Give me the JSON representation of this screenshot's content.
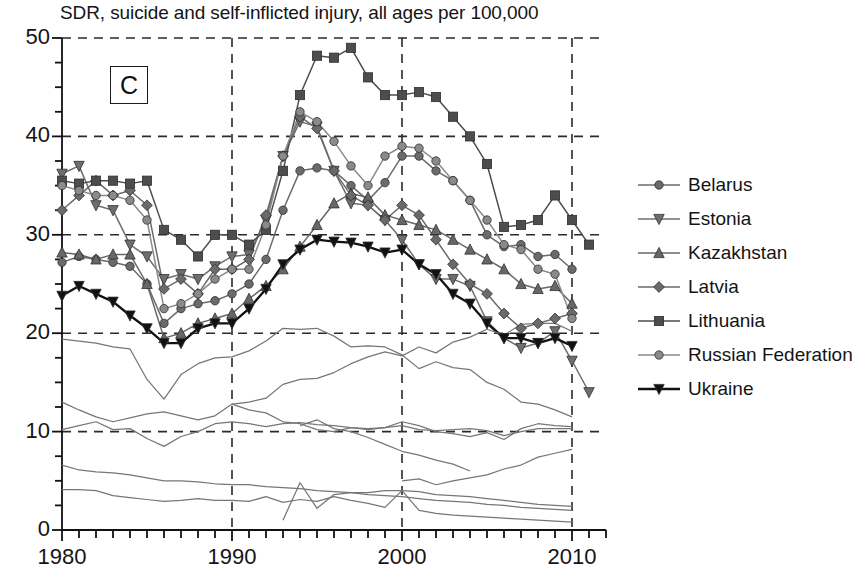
{
  "chart": {
    "title": "SDR, suicide and self-inflicted injury, all ages per 100,000",
    "panel_label": "C"
  },
  "axes": {
    "y_ticks": [
      "0",
      "10",
      "20",
      "30",
      "40",
      "50"
    ],
    "x_ticks": [
      "1980",
      "1990",
      "2000",
      "2010"
    ]
  },
  "legend": {
    "items": [
      {
        "label": "Belarus",
        "marker": "circle",
        "color": "#6b6b6b",
        "filled": true
      },
      {
        "label": "Estonia",
        "marker": "triangle-down",
        "color": "#6e6e6e",
        "filled": true
      },
      {
        "label": "Kazakhstan",
        "marker": "triangle-up",
        "color": "#676767",
        "filled": true
      },
      {
        "label": "Latvia",
        "marker": "diamond",
        "color": "#6a6a6a",
        "filled": true
      },
      {
        "label": "Lithuania",
        "marker": "square",
        "color": "#4d4d4d",
        "filled": true
      },
      {
        "label": "Russian Federation",
        "marker": "circle",
        "color": "#8a8a8a",
        "filled": true
      },
      {
        "label": "Ukraine",
        "marker": "triangle-down",
        "color": "#111111",
        "filled": true
      }
    ]
  },
  "chart_data": {
    "type": "line",
    "title": "SDR, suicide and self-inflicted injury, all ages per 100,000",
    "xlabel": "",
    "ylabel": "",
    "xlim": [
      1980,
      2012
    ],
    "ylim": [
      0,
      50
    ],
    "grid": true,
    "grid_y": [
      10,
      20,
      30,
      40,
      50
    ],
    "grid_x": [
      1990,
      2000,
      2010
    ],
    "legend_position": "right",
    "x": [
      1980,
      1981,
      1982,
      1983,
      1984,
      1985,
      1986,
      1987,
      1988,
      1989,
      1990,
      1991,
      1992,
      1993,
      1994,
      1995,
      1996,
      1997,
      1998,
      1999,
      2000,
      2001,
      2002,
      2003,
      2004,
      2005,
      2006,
      2007,
      2008,
      2009,
      2010,
      2011
    ],
    "series": [
      {
        "name": "Belarus",
        "marker": "circle",
        "color": "#6b6b6b",
        "values": [
          27.2,
          27.8,
          27.5,
          27.2,
          26.8,
          25.0,
          21.0,
          22.5,
          23.0,
          23.3,
          24.0,
          25.0,
          27.5,
          32.5,
          36.5,
          36.8,
          36.5,
          35.0,
          33.5,
          35.3,
          38.0,
          38.0,
          36.5,
          35.5,
          33.5,
          30.0,
          28.8,
          29.0,
          27.8,
          28.0,
          26.5,
          null
        ]
      },
      {
        "name": "Estonia",
        "marker": "triangle-down",
        "color": "#6e6e6e",
        "values": [
          36.2,
          37.0,
          33.0,
          32.5,
          29.0,
          27.8,
          25.5,
          26.0,
          25.5,
          26.8,
          27.8,
          28.0,
          31.5,
          38.0,
          41.5,
          41.0,
          36.5,
          33.2,
          33.0,
          31.5,
          29.5,
          27.0,
          25.5,
          25.5,
          24.8,
          21.2,
          19.5,
          18.5,
          19.0,
          20.2,
          17.2,
          14.0
        ]
      },
      {
        "name": "Kazakhstan",
        "marker": "triangle-up",
        "color": "#676767",
        "values": [
          28.2,
          28.0,
          27.5,
          28.0,
          28.0,
          25.0,
          19.5,
          20.0,
          21.0,
          21.5,
          22.0,
          23.5,
          24.8,
          26.5,
          28.8,
          31.0,
          33.2,
          34.2,
          33.8,
          32.0,
          31.5,
          31.0,
          30.5,
          29.5,
          28.5,
          27.5,
          26.5,
          25.0,
          24.5,
          24.8,
          23.0,
          null
        ]
      },
      {
        "name": "Latvia",
        "marker": "diamond",
        "color": "#6a6a6a",
        "values": [
          32.5,
          34.0,
          35.5,
          34.0,
          34.5,
          33.0,
          24.5,
          25.5,
          24.0,
          26.5,
          26.5,
          27.5,
          32.0,
          38.0,
          42.0,
          40.8,
          36.5,
          34.0,
          33.0,
          31.5,
          33.0,
          32.0,
          29.5,
          27.0,
          25.0,
          24.0,
          22.0,
          20.5,
          21.0,
          21.5,
          22.0,
          null
        ]
      },
      {
        "name": "Lithuania",
        "marker": "square",
        "color": "#4d4d4d",
        "values": [
          35.5,
          35.2,
          35.5,
          35.5,
          35.2,
          35.5,
          30.5,
          29.5,
          27.8,
          30.0,
          30.0,
          29.0,
          30.5,
          36.5,
          44.2,
          48.2,
          48.0,
          49.0,
          46.0,
          44.2,
          44.2,
          44.5,
          44.0,
          42.0,
          40.0,
          37.2,
          30.8,
          31.0,
          31.5,
          34.0,
          31.5,
          29.0
        ]
      },
      {
        "name": "Russian Federation",
        "marker": "circle",
        "color": "#8a8a8a",
        "values": [
          35.0,
          34.5,
          34.0,
          34.0,
          33.5,
          31.5,
          22.5,
          23.0,
          24.0,
          25.5,
          26.5,
          26.5,
          31.0,
          38.0,
          42.5,
          41.5,
          39.5,
          37.0,
          35.0,
          38.0,
          39.0,
          38.8,
          37.5,
          35.5,
          33.5,
          31.5,
          29.0,
          28.5,
          26.5,
          26.0,
          21.5,
          null
        ]
      },
      {
        "name": "Ukraine",
        "marker": "triangle-down",
        "color": "#111111",
        "values": [
          23.8,
          24.8,
          24.0,
          23.2,
          21.8,
          20.5,
          19.0,
          19.0,
          20.5,
          21.0,
          21.0,
          22.5,
          24.5,
          27.0,
          28.5,
          29.5,
          29.3,
          29.2,
          28.8,
          28.2,
          28.5,
          27.0,
          26.0,
          24.0,
          23.0,
          21.0,
          19.5,
          19.5,
          19.0,
          19.5,
          18.7,
          null
        ]
      },
      {
        "name": "background-1",
        "marker": "none",
        "color": "#7f7f7f",
        "values": [
          19.4,
          19.2,
          19.0,
          18.6,
          18.4,
          15.3,
          13.3,
          15.8,
          16.9,
          17.5,
          17.6,
          18.2,
          19.2,
          20.5,
          20.4,
          20.5,
          19.7,
          18.6,
          18.7,
          18.6,
          17.8,
          16.4,
          17.1,
          16.5,
          16.3,
          15.0,
          14.3,
          13.0,
          12.8,
          12.2,
          11.5,
          null
        ]
      },
      {
        "name": "background-2",
        "marker": "none",
        "color": "#7f7f7f",
        "values": [
          13.0,
          12.2,
          11.5,
          11.0,
          11.4,
          11.8,
          12.0,
          11.6,
          11.2,
          11.6,
          12.8,
          12.2,
          11.9,
          11.0,
          10.8,
          10.2,
          10.0,
          10.4,
          10.2,
          10.4,
          11.0,
          10.6,
          10.0,
          9.8,
          9.5,
          9.9,
          9.2,
          10.3,
          10.8,
          10.6,
          10.5,
          null
        ]
      },
      {
        "name": "background-3",
        "marker": "none",
        "color": "#7f7f7f",
        "values": [
          10.2,
          10.6,
          11.0,
          10.2,
          10.3,
          9.3,
          8.5,
          9.5,
          10.0,
          10.8,
          11.0,
          10.8,
          10.5,
          10.8,
          10.9,
          10.7,
          10.6,
          10.4,
          10.3,
          10.4,
          10.6,
          10.2,
          10.1,
          10.2,
          10.3,
          10.1,
          9.6,
          10.0,
          10.3,
          10.3,
          10.3,
          null
        ]
      },
      {
        "name": "background-4",
        "marker": "none",
        "color": "#7f7f7f",
        "values": [
          6.6,
          6.1,
          5.9,
          5.8,
          5.6,
          5.3,
          5.0,
          5.0,
          4.9,
          4.7,
          4.6,
          4.6,
          4.4,
          4.3,
          4.2,
          4.0,
          3.9,
          3.8,
          3.6,
          3.5,
          3.4,
          3.2,
          3.0,
          2.9,
          2.8,
          2.6,
          2.5,
          2.3,
          2.2,
          2.1,
          2.0,
          null
        ]
      },
      {
        "name": "background-5",
        "marker": "none",
        "color": "#7f7f7f",
        "values": [
          4.1,
          4.1,
          4.0,
          3.5,
          3.3,
          3.1,
          2.9,
          3.0,
          3.2,
          3.0,
          3.0,
          2.9,
          3.4,
          2.8,
          3.1,
          2.9,
          3.4,
          3.0,
          2.7,
          2.3,
          4.0,
          2.0,
          1.7,
          1.5,
          1.4,
          1.3,
          1.2,
          1.1,
          1.0,
          0.9,
          0.8,
          null
        ]
      },
      {
        "name": "background-6",
        "marker": "none",
        "color": "#7f7f7f",
        "values": [
          null,
          null,
          null,
          null,
          null,
          null,
          null,
          null,
          null,
          null,
          12.8,
          13.0,
          13.4,
          14.8,
          15.3,
          15.4,
          16.0,
          16.9,
          17.6,
          18.1,
          17.7,
          18.6,
          18.0,
          19.1,
          19.6,
          20.4,
          19.8,
          20.9,
          21.0,
          21.0,
          20.2,
          null
        ]
      },
      {
        "name": "background-7",
        "marker": "none",
        "color": "#7f7f7f",
        "values": [
          null,
          null,
          null,
          null,
          null,
          null,
          null,
          null,
          null,
          null,
          null,
          null,
          null,
          null,
          null,
          null,
          null,
          null,
          null,
          null,
          5.0,
          5.2,
          4.6,
          5.0,
          5.3,
          5.6,
          6.2,
          6.6,
          7.4,
          7.8,
          8.2,
          null
        ]
      },
      {
        "name": "background-8",
        "marker": "none",
        "color": "#7f7f7f",
        "values": [
          null,
          null,
          null,
          null,
          null,
          null,
          null,
          null,
          null,
          null,
          null,
          null,
          null,
          null,
          10.6,
          11.2,
          10.3,
          10.0,
          9.4,
          8.7,
          8.0,
          7.6,
          7.1,
          6.7,
          6.0,
          null,
          null,
          null,
          null,
          null,
          null,
          null
        ]
      },
      {
        "name": "background-9",
        "marker": "none",
        "color": "#7f7f7f",
        "values": [
          null,
          null,
          null,
          null,
          null,
          null,
          null,
          null,
          null,
          null,
          null,
          null,
          null,
          1.0,
          4.8,
          2.2,
          3.6,
          3.8,
          3.8,
          4.0,
          4.0,
          3.9,
          3.6,
          3.5,
          3.4,
          3.2,
          3.0,
          2.8,
          2.6,
          2.5,
          2.4,
          null
        ]
      }
    ]
  }
}
